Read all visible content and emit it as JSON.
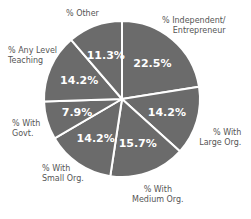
{
  "chart_data": {
    "type": "pie",
    "title": "",
    "slice_color": "#6b6b6b",
    "divider_color": "#ffffff",
    "start_angle_deg": 0,
    "direction": "clockwise",
    "slices": [
      {
        "label": "% Independent/ Entrepreneur",
        "line1": "% Independent/",
        "line2": "Entrepreneur",
        "value": 22.5,
        "display": "22.5%"
      },
      {
        "label": "% With Large Org.",
        "line1": "% With",
        "line2": "Large Org.",
        "value": 14.2,
        "display": "14.2%"
      },
      {
        "label": "% With Medium Org.",
        "line1": "% With",
        "line2": "Medium Org.",
        "value": 15.7,
        "display": "15.7%"
      },
      {
        "label": "% With Small Org.",
        "line1": "% With",
        "line2": "Small Org.",
        "value": 14.2,
        "display": "14.2%"
      },
      {
        "label": "% With Govt.",
        "line1": "% With",
        "line2": "Govt.",
        "value": 7.9,
        "display": "7.9%"
      },
      {
        "label": "% Any Level Teaching",
        "line1": "% Any Level",
        "line2": "Teaching",
        "value": 14.2,
        "display": "14.2%"
      },
      {
        "label": "% Other",
        "line1": "% Other",
        "line2": "",
        "value": 11.3,
        "display": "11.3%"
      }
    ]
  }
}
